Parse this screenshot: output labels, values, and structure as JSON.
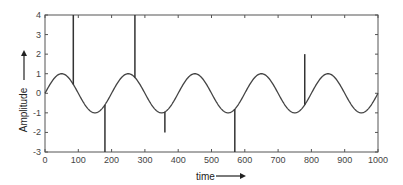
{
  "chart_data": {
    "type": "line",
    "title": "",
    "xlabel": "time",
    "ylabel": "Amplitude",
    "xlim": [
      0,
      1000
    ],
    "ylim": [
      -3,
      4
    ],
    "x_ticks": [
      0,
      100,
      200,
      300,
      400,
      500,
      600,
      700,
      800,
      900,
      1000
    ],
    "y_ticks": [
      -3,
      -2,
      -1,
      0,
      1,
      2,
      3,
      4
    ],
    "grid": false,
    "legend": null,
    "series": [
      {
        "name": "signal",
        "description": "sine wave, amplitude 1, period 200, sin(2*pi*t/200)",
        "amplitude": 1,
        "period": 200,
        "phase": 0,
        "color": "#444444"
      },
      {
        "name": "spikes",
        "description": "impulsive noise spikes superimposed on the sine",
        "points": [
          {
            "t": 85,
            "value": 4
          },
          {
            "t": 180,
            "value": -3
          },
          {
            "t": 270,
            "value": 4
          },
          {
            "t": 360,
            "value": -2
          },
          {
            "t": 570,
            "value": -3
          },
          {
            "t": 780,
            "value": 2
          }
        ],
        "color": "#333333"
      }
    ],
    "annotations": [
      "arrow along x-axis label 'time →'",
      "arrow along y-axis label 'Amplitude ↑'"
    ]
  },
  "layout": {
    "plot": {
      "left": 45,
      "top": 15,
      "right": 378,
      "bottom": 152
    }
  }
}
